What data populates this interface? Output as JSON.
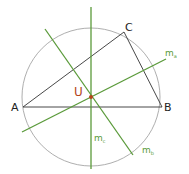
{
  "diagram": {
    "type": "circumcircle-construction",
    "points": {
      "A": {
        "label": "A",
        "x": 23,
        "y": 107
      },
      "B": {
        "label": "B",
        "x": 162,
        "y": 107
      },
      "C": {
        "label": "C",
        "x": 124,
        "y": 32
      },
      "U": {
        "label": "U",
        "x": 91,
        "y": 97
      }
    },
    "circle": {
      "cx": 91,
      "cy": 97,
      "r": 69
    },
    "bisectors": [
      {
        "label": "m",
        "sub": "a",
        "x1": 22,
        "y1": 132,
        "x2": 166,
        "y2": 59
      },
      {
        "label": "m",
        "sub": "b",
        "x1": 45,
        "y1": 29,
        "x2": 133,
        "y2": 155
      },
      {
        "label": "m",
        "sub": "c",
        "x1": 91,
        "y1": 7,
        "x2": 91,
        "y2": 169
      }
    ],
    "colors": {
      "triangle": "#333333",
      "circle": "#999999",
      "bisector": "#5a9a3a",
      "center": "#b5451b"
    }
  }
}
